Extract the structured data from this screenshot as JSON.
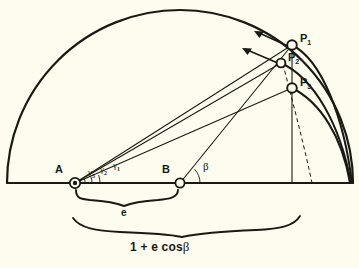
{
  "figure": {
    "background_color": "#fdfcef",
    "ink_color": "#1a1a14",
    "width": 359,
    "height": 268
  },
  "points": [
    {
      "id": "A",
      "label": "A",
      "subscript": "",
      "x": 75,
      "y": 183,
      "marker": "double-circle",
      "label_x": 57,
      "label_y": 170
    },
    {
      "id": "B",
      "label": "B",
      "subscript": "",
      "x": 180,
      "y": 183,
      "marker": "circle",
      "label_x": 163,
      "label_y": 170
    },
    {
      "id": "P1",
      "label": "P",
      "subscript": "1",
      "x": 292,
      "y": 45,
      "marker": "circle",
      "label_x": 300,
      "label_y": 38
    },
    {
      "id": "P2",
      "label": "P",
      "subscript": "2",
      "x": 281,
      "y": 63,
      "marker": "circle",
      "label_x": 288,
      "label_y": 57
    },
    {
      "id": "P3",
      "label": "P",
      "subscript": "3",
      "x": 292,
      "y": 88,
      "marker": "circle",
      "label_x": 300,
      "label_y": 82
    }
  ],
  "angles": [
    {
      "id": "gamma1",
      "symbol": "γ",
      "subscript": "1",
      "vertex": "A",
      "label_x": 116,
      "label_y": 166
    },
    {
      "id": "gamma2",
      "symbol": "γ",
      "subscript": "2",
      "vertex": "A",
      "label_x": 103,
      "label_y": 168
    },
    {
      "id": "gamma3",
      "symbol": "γ",
      "subscript": "3",
      "vertex": "A",
      "label_x": 91,
      "label_y": 170
    },
    {
      "id": "beta",
      "symbol": "β",
      "subscript": "",
      "vertex": "B",
      "label_x": 203,
      "label_y": 166
    }
  ],
  "braces": [
    {
      "id": "brace-e",
      "label": "e",
      "from_x": 75,
      "to_x": 180,
      "label_x": 124,
      "label_y": 213
    },
    {
      "id": "brace-focal-chord",
      "label": "1 + e cos β",
      "label_plain": "1 + e cos",
      "label_greek": "β",
      "from_x": 75,
      "to_x": 300,
      "label_x": 134,
      "label_y": 243
    }
  ],
  "baseline": {
    "name": "horizontal-axis",
    "x1": 7,
    "x2": 352,
    "y": 183
  },
  "semicircle": {
    "name": "outer-semicircle",
    "center_x": 180,
    "center_y": 183,
    "radius": 173
  },
  "arcs": [
    {
      "id": "arc-1",
      "from": "P1",
      "to_x": 352,
      "to_y": 183,
      "style": "solid"
    },
    {
      "id": "arc-2",
      "from": "P2",
      "to_x": 352,
      "to_y": 183,
      "style": "solid"
    },
    {
      "id": "arc-3",
      "from": "P3",
      "to_x": 352,
      "to_y": 183,
      "style": "solid"
    },
    {
      "id": "arc-dashed",
      "from": "P2",
      "to_x": 312,
      "to_y": 183,
      "style": "dashed"
    }
  ],
  "rays": [
    {
      "id": "ray-A-P1",
      "from": "A",
      "to": "P1"
    },
    {
      "id": "ray-A-P2",
      "from": "A",
      "to": "P2"
    },
    {
      "id": "ray-A-P3",
      "from": "A",
      "to": "P3"
    },
    {
      "id": "ray-B-P1",
      "from": "B",
      "to": "P1"
    }
  ],
  "arrows": [
    {
      "id": "velocity-arrow-1",
      "tail_x": 290,
      "tail_y": 47,
      "head_x": 255,
      "head_y": 31
    },
    {
      "id": "velocity-arrow-2",
      "tail_x": 280,
      "tail_y": 64,
      "head_x": 243,
      "head_y": 48
    }
  ],
  "vertical_drop": {
    "name": "vertical-drop-line",
    "x": 292,
    "y1": 45,
    "y2": 183
  }
}
